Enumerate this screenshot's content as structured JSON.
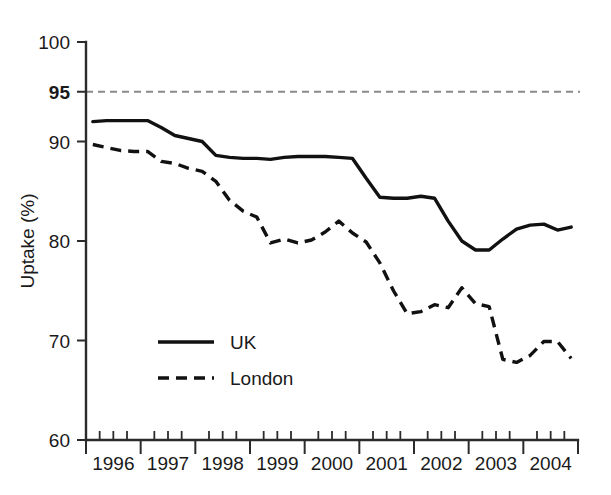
{
  "chart_data": {
    "type": "line",
    "title": "",
    "subtitle": "",
    "xlabel": "",
    "ylabel": "Uptake (%)",
    "ylim": [
      60,
      100
    ],
    "xlim": [
      1996.0,
      1996.0
    ],
    "grid": false,
    "legend_position": "inside-lower-left",
    "y_ticks": [
      {
        "value": 100,
        "label": "100",
        "bold": false
      },
      {
        "value": 95,
        "label": "95",
        "bold": true
      },
      {
        "value": 90,
        "label": "90",
        "bold": false
      },
      {
        "value": 80,
        "label": "80",
        "bold": false
      },
      {
        "value": 70,
        "label": "70",
        "bold": false
      },
      {
        "value": 60,
        "label": "60",
        "bold": false
      }
    ],
    "x_tick_labels": [
      "1996",
      "1997",
      "1998",
      "1999",
      "2000",
      "2001",
      "2002",
      "2003",
      "2004"
    ],
    "x_minor_ticks_per_year": 4,
    "annotations": [
      {
        "name": "target-line",
        "type": "hline",
        "value": 95,
        "style": "dashed",
        "color": "#8a8a8a",
        "label": ""
      }
    ],
    "x_quarters": [
      "1996Q1",
      "1996Q2",
      "1996Q3",
      "1996Q4",
      "1997Q1",
      "1997Q2",
      "1997Q3",
      "1997Q4",
      "1998Q1",
      "1998Q2",
      "1998Q3",
      "1998Q4",
      "1999Q1",
      "1999Q2",
      "1999Q3",
      "1999Q4",
      "2000Q1",
      "2000Q2",
      "2000Q3",
      "2000Q4",
      "2001Q1",
      "2001Q2",
      "2001Q3",
      "2001Q4",
      "2002Q1",
      "2002Q2",
      "2002Q3",
      "2002Q4",
      "2003Q1",
      "2003Q2",
      "2003Q3",
      "2003Q4",
      "2004Q1",
      "2004Q2",
      "2004Q3",
      "2004Q4"
    ],
    "series": [
      {
        "name": "UK",
        "style": "solid",
        "color": "#111111",
        "values": [
          92.0,
          92.1,
          92.1,
          92.1,
          92.1,
          91.4,
          90.6,
          90.3,
          90.0,
          88.6,
          88.4,
          88.3,
          88.3,
          88.2,
          88.4,
          88.5,
          88.5,
          88.5,
          88.4,
          88.3,
          86.3,
          84.4,
          84.3,
          84.3,
          84.5,
          84.3,
          82.0,
          80.0,
          79.1,
          79.1,
          80.2,
          81.2,
          81.6,
          81.7,
          81.1,
          81.4
        ]
      },
      {
        "name": "London",
        "style": "dashed",
        "color": "#111111",
        "values": [
          89.7,
          89.4,
          89.1,
          89.0,
          89.0,
          88.0,
          87.8,
          87.3,
          87.0,
          86.0,
          84.1,
          83.0,
          82.4,
          79.8,
          80.2,
          79.8,
          80.1,
          80.9,
          82.0,
          80.8,
          79.9,
          77.8,
          75.0,
          72.7,
          72.9,
          73.6,
          73.3,
          75.3,
          73.7,
          73.4,
          68.1,
          67.8,
          68.5,
          69.9,
          69.9,
          68.2
        ]
      }
    ]
  },
  "legend": {
    "entries": [
      {
        "label": "UK",
        "style": "solid"
      },
      {
        "label": "London",
        "style": "dashed"
      }
    ]
  }
}
